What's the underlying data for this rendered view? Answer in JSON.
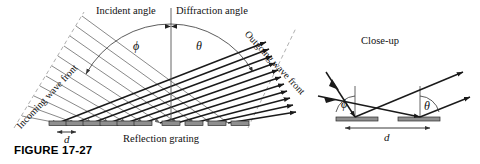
{
  "figure": {
    "caption": "FIGURE 17-27",
    "main_panel": {
      "top_labels": {
        "incident": "Incident angle",
        "diffraction": "Diffraction angle"
      },
      "rotated_labels": {
        "incoming": "Incoming wave front",
        "outgoing": "Outgoing wave front"
      },
      "angle_symbols": {
        "incident_angle": "ϕ",
        "diffraction_angle": "θ"
      },
      "spacing_label": "d",
      "baseline_label": "Reflection grating",
      "grating_element_count": 10
    },
    "closeup_panel": {
      "title": "Close-up",
      "angle_symbols": {
        "incident_angle": "ϕ",
        "diffraction_angle": "θ"
      },
      "spacing_label": "d",
      "grating_element_count": 2
    },
    "colors": {
      "ink": "#111111",
      "incoming_ray": "#6b6b6b",
      "outgoing_ray": "#1a1a1a",
      "grating_fill": "#8f8f8f",
      "grating_stroke": "#2b2b2b",
      "background": "#ffffff"
    }
  }
}
